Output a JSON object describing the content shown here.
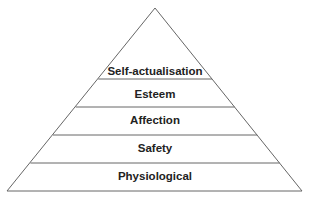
{
  "diagram": {
    "type": "pyramid",
    "title": "",
    "levels": [
      {
        "label": "Self-actualisation",
        "y_line": 79,
        "y_text": 75
      },
      {
        "label": "Esteem",
        "y_line": 107,
        "y_text": 98
      },
      {
        "label": "Affection",
        "y_line": 135,
        "y_text": 124
      },
      {
        "label": "Safety",
        "y_line": 163,
        "y_text": 152
      },
      {
        "label": "Physiological",
        "y_line": 191,
        "y_text": 180
      }
    ],
    "colors": {
      "stroke": "#666666",
      "text": "#222222",
      "background": "#ffffff"
    }
  }
}
